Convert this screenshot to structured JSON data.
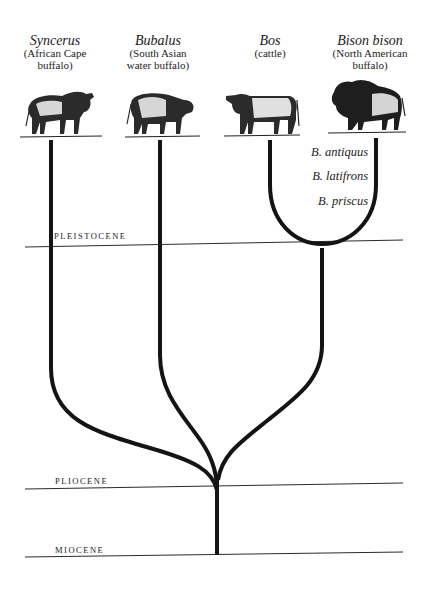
{
  "taxa": [
    {
      "name": "Syncerus",
      "common_line1": "(African Cape",
      "common_line2": "buffalo)",
      "center_x": 55,
      "animal": "cape-buffalo"
    },
    {
      "name": "Bubalus",
      "common_line1": "(South Asian",
      "common_line2": "water buffalo)",
      "center_x": 158,
      "animal": "water-buffalo"
    },
    {
      "name": "Bos",
      "common_line1": "(cattle)",
      "common_line2": "",
      "center_x": 270,
      "animal": "cattle"
    },
    {
      "name": "Bison bison",
      "common_line1": "(North American",
      "common_line2": "buffalo)",
      "center_x": 370,
      "animal": "american-bison"
    }
  ],
  "fossil_species": [
    {
      "name": "B. antiquus"
    },
    {
      "name": "B. latifrons"
    },
    {
      "name": "B. priscus"
    }
  ],
  "epochs": [
    {
      "label": "PLEISTOCENE",
      "y": 244
    },
    {
      "label": "PLIOCENE",
      "y": 487
    },
    {
      "label": "MIOCENE",
      "y": 555
    }
  ],
  "colors": {
    "branch": "#141414",
    "epoch_line": "#2a2a2a",
    "background": "#ffffff"
  }
}
